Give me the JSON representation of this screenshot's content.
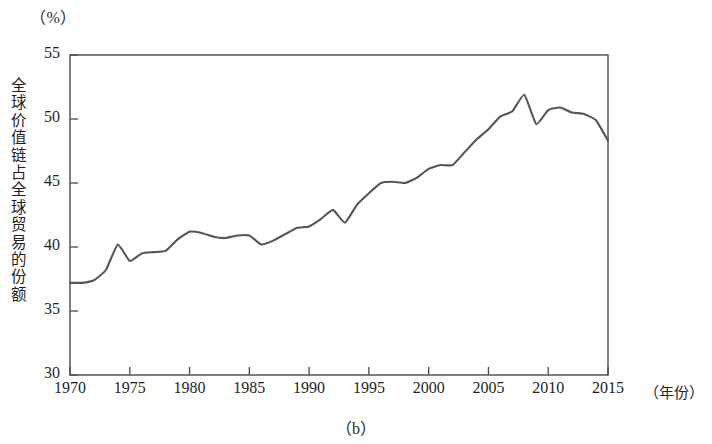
{
  "figure": {
    "unit_label": "（%）",
    "y_axis_title": "全球价值链占全球贸易的份额",
    "x_axis_title": "（年份）",
    "caption": "（b）"
  },
  "chart_data": {
    "type": "line",
    "title": "",
    "subtitle": "",
    "xlabel": "（年份）",
    "ylabel": "全球价值链占全球贸易的份额",
    "unit": "%",
    "caption": "（b）",
    "grid": false,
    "legend": "none",
    "xlim": [
      1970,
      2015
    ],
    "ylim": [
      30,
      55
    ],
    "xticks": [
      1970,
      1975,
      1980,
      1985,
      1990,
      1995,
      2000,
      2005,
      2010,
      2015
    ],
    "xtick_labels": [
      "1970",
      "1975",
      "1980",
      "1985",
      "1990",
      "1995",
      "2000",
      "2005",
      "2010",
      "2015"
    ],
    "yticks": [
      30,
      35,
      40,
      45,
      50,
      55
    ],
    "ytick_labels": [
      "30",
      "35",
      "40",
      "45",
      "50",
      "55"
    ],
    "line_color": "#565656",
    "series": [
      {
        "name": "全球价值链占全球贸易的份额",
        "x": [
          1970,
          1971,
          1972,
          1973,
          1974,
          1975,
          1976,
          1977,
          1978,
          1979,
          1980,
          1981,
          1982,
          1983,
          1984,
          1985,
          1986,
          1987,
          1988,
          1989,
          1990,
          1991,
          1992,
          1993,
          1994,
          1995,
          1996,
          1997,
          1998,
          1999,
          2000,
          2001,
          2002,
          2003,
          2004,
          2005,
          2006,
          2007,
          2008,
          2009,
          2010,
          2011,
          2012,
          2013,
          2014,
          2015
        ],
        "values": [
          37.2,
          37.2,
          37.4,
          38.2,
          40.2,
          38.9,
          39.5,
          39.6,
          39.7,
          40.6,
          41.2,
          41.1,
          40.8,
          40.7,
          40.9,
          40.9,
          40.2,
          40.5,
          41.0,
          41.5,
          41.6,
          42.2,
          42.9,
          41.9,
          43.3,
          44.2,
          45.0,
          45.1,
          45.0,
          45.4,
          46.1,
          46.4,
          46.4,
          47.4,
          48.4,
          49.2,
          50.2,
          50.6,
          51.9,
          49.6,
          50.7,
          50.9,
          50.5,
          50.4,
          49.9,
          48.3
        ]
      }
    ]
  }
}
